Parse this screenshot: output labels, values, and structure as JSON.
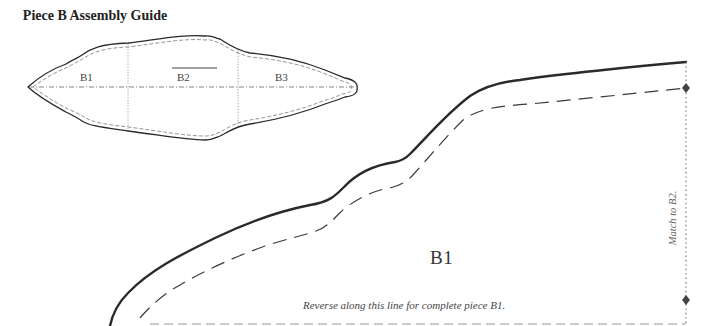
{
  "guide": {
    "title": "Piece B Assembly Guide",
    "sections": [
      {
        "label": "B1"
      },
      {
        "label": "B2"
      },
      {
        "label": "B3"
      }
    ],
    "grainline_direction": "horizontal"
  },
  "pattern": {
    "piece_label": "B1",
    "fold_note": "Reverse along this line for complete piece B1.",
    "match_note": "Match to B2.",
    "notch_markers": 2
  },
  "colors": {
    "cut_line": "#2a2a2a",
    "seam_line": "#444444",
    "guide_line": "#777777",
    "background": "#ffffff"
  }
}
